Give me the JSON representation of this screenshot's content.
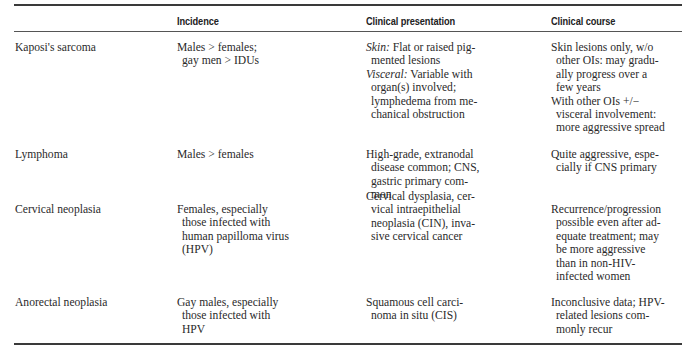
{
  "table": {
    "headers": [
      "",
      "Incidence",
      "Clinical presentation",
      "Clinical course"
    ],
    "rows": [
      {
        "condition": "Kaposi's sarcoma",
        "incidence": [
          "Males > females;",
          "gay men > IDUs"
        ],
        "presentation": [
          {
            "label": "Skin:",
            "text": " Flat or raised pig-"
          },
          {
            "text": "mented lesions"
          },
          {
            "label": "Visceral:",
            "text": " Variable with"
          },
          {
            "text": "organ(s) involved;"
          },
          {
            "text": "lymphedema from me-"
          },
          {
            "text": "chanical obstruction"
          }
        ],
        "course": [
          "Skin lesions only, w/o",
          "other OIs: may gradu-",
          "ally progress over a",
          "few years",
          "With other OIs +/−",
          "visceral involvement:",
          "more aggressive spread"
        ]
      },
      {
        "condition": "Lymphoma",
        "incidence": [
          "Males > females"
        ],
        "presentation": [
          "High-grade, extranodal",
          "disease common; CNS,",
          "gastric primary com-",
          "mon"
        ],
        "course": [
          "Quite aggressive, espe-",
          "cially if CNS primary"
        ]
      },
      {
        "condition": "Cervical neoplasia",
        "incidence": [
          "Females, especially",
          "those infected with",
          "human papilloma virus",
          "(HPV)"
        ],
        "presentation": [
          "Cervical dysplasia, cer-",
          "vical intraepithelial",
          "neoplasia (CIN), inva-",
          "sive cervical cancer"
        ],
        "course": [
          "Recurrence/progression",
          "possible even after ad-",
          "equate treatment; may",
          "be more aggressive",
          "than in non-HIV-",
          "infected women"
        ]
      },
      {
        "condition": "Anorectal neoplasia",
        "incidence": [
          "Gay males, especially",
          "those infected with",
          "HPV"
        ],
        "presentation": [
          "Squamous cell carci-",
          "noma in situ (CIS)"
        ],
        "course": [
          "Inconclusive data; HPV-",
          "related lesions com-",
          "monly recur"
        ]
      }
    ]
  }
}
